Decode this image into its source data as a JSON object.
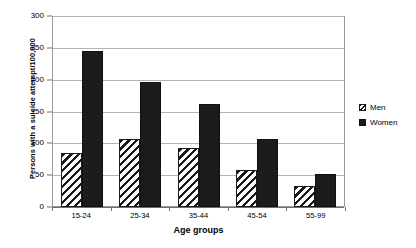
{
  "chart_data": {
    "type": "bar",
    "title": "",
    "categories": [
      "15-24",
      "25-34",
      "35-44",
      "45-54",
      "55-99"
    ],
    "series": [
      {
        "name": "Men",
        "values": [
          86,
          108,
          93,
          58,
          33
        ],
        "fill": "diagonal-hatch",
        "color": "#ffffff"
      },
      {
        "name": "Women",
        "values": [
          246,
          198,
          163,
          108,
          52
        ],
        "fill": "solid",
        "color": "#1c1c1c"
      }
    ],
    "xlabel": "Age groups",
    "ylabel": "Persons with a suicide attempt/100,000",
    "ylim": [
      0,
      300
    ],
    "yticks": [
      0,
      50,
      100,
      150,
      200,
      250,
      300
    ],
    "grid": "horizontal",
    "legend_position": "right"
  },
  "axes": {
    "y_title": "Persons with a suicide attempt/100,000",
    "x_title": "Age groups",
    "y_tick_labels": [
      "300",
      "250",
      "200",
      "150",
      "100",
      "50",
      "0"
    ],
    "x_tick_labels": [
      "15-24",
      "25-34",
      "35-44",
      "45-54",
      "55-99"
    ]
  },
  "legend": {
    "items": [
      {
        "label": "Men"
      },
      {
        "label": "Women"
      }
    ]
  }
}
